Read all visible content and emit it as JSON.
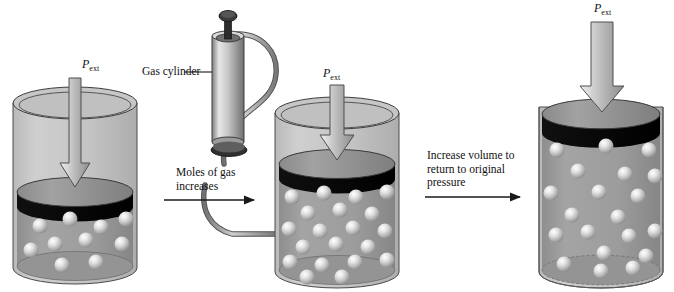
{
  "figure": {
    "type": "diagram",
    "background_color": "#ffffff",
    "ink_color": "#111111"
  },
  "labels": {
    "gas_cylinder": "Gas cylinder",
    "moles_increase": "Moles of gas\nincreases",
    "increase_volume": "Increase volume to\nreturn to original\npressure",
    "pext_symbol": "P",
    "pext_subscript": "ext"
  },
  "panels": [
    {
      "id": "panel-1",
      "name": "initial-container",
      "pext_label": "P ext",
      "particle_count": 10,
      "gas_region": "lower third",
      "piston_color": "#0b0b0b",
      "piston_top_color": "#8d8d8d",
      "gas_color": "#9a9a9a",
      "vessel_color": "#c2c2c2"
    },
    {
      "id": "panel-2",
      "name": "gas-added-container",
      "pext_label": "P ext",
      "particle_count": 20,
      "gas_region": "lower two thirds",
      "piston_color": "#0b0b0b",
      "piston_top_color": "#8d8d8d",
      "gas_color": "#9a9a9a",
      "vessel_color": "#c2c2c2"
    },
    {
      "id": "panel-3",
      "name": "expanded-container",
      "pext_label": "P ext",
      "particle_count": 20,
      "gas_region": "full vessel",
      "piston_color": "#0b0b0b",
      "piston_top_color": "#8d8d8d",
      "gas_color": "#9a9a9a",
      "vessel_color": "#c2c2c2"
    }
  ],
  "arrows": {
    "pressure_arrow_color_light": "#e8e8e8",
    "pressure_arrow_color_dark": "#8a8a8a",
    "process_arrow_color": "#1a1a1a",
    "process_arrow_1": "Moles of gas increases",
    "process_arrow_2": "Increase volume to return to original pressure"
  },
  "apparatus": {
    "name": "gas-cylinder",
    "body_color": "#c9c9c9",
    "valve_color": "#2a2a2a",
    "hose_color": "#9c9c9c"
  }
}
